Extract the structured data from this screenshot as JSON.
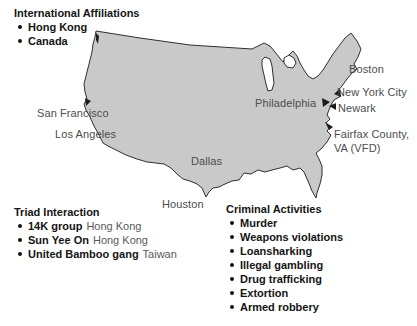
{
  "colors": {
    "background": "#ffffff",
    "map_fill": "#c9c9c9",
    "map_outline": "#2f2f2f",
    "city_label": "#4d4d4d",
    "text": "#141414"
  },
  "map": {
    "name": "United States outline map",
    "lakes": [
      "Lake Michigan",
      "Lake Huron"
    ],
    "pointer_icons": [
      "puget-sound-mark",
      "san-francisco-pointer",
      "new-york-city-pointer",
      "philadelphia-pointer",
      "newark-pointer",
      "fairfax-pointer"
    ]
  },
  "cities": {
    "san_francisco": "San Francisco",
    "los_angeles": "Los Angeles",
    "dallas": "Dallas",
    "houston": "Houston",
    "philadelphia": "Philadelphia",
    "boston": "Boston",
    "new_york_city": "New York City",
    "newark": "Newark",
    "fairfax_line1": "Fairfax County,",
    "fairfax_line2": "VA (VFD)"
  },
  "lists": {
    "international": {
      "title": "International Affiliations",
      "items": [
        "Hong Kong",
        "Canada"
      ]
    },
    "triad": {
      "title": "Triad Interaction",
      "items": [
        {
          "group": "14K group",
          "origin": "Hong Kong"
        },
        {
          "group": "Sun Yee On",
          "origin": "Hong Kong"
        },
        {
          "group": "United Bamboo gang",
          "origin": "Taiwan"
        }
      ]
    },
    "criminal": {
      "title": "Criminal Activities",
      "items": [
        "Murder",
        "Weapons violations",
        "Loansharking",
        "Illegal gambling",
        "Drug trafficking",
        "Extortion",
        "Armed robbery"
      ]
    }
  }
}
